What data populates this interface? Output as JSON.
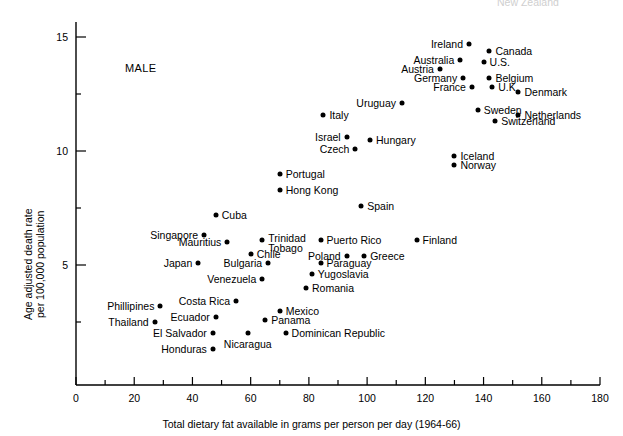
{
  "figure": {
    "annotation": "MALE",
    "clipped_top_label": "New Zealand",
    "xlabel": "Total dietary fat available in grams per person per day (1964-66)",
    "ylabel_line1": "Age adjusted death rate",
    "ylabel_line2": "per 100,000 population"
  },
  "chart_data": {
    "type": "scatter",
    "title": "",
    "xlabel": "Total dietary fat available in grams per person per day (1964-66)",
    "ylabel": "Age adjusted death rate per 100,000 population",
    "xlim": [
      0,
      180
    ],
    "ylim": [
      0,
      16
    ],
    "xticks": [
      0,
      20,
      40,
      60,
      80,
      100,
      120,
      140,
      160,
      180
    ],
    "yticks": [
      5,
      10,
      15
    ],
    "xminor_step": 10,
    "yminor_step": 2.5,
    "grid": false,
    "legend": null,
    "annotations": [
      "MALE"
    ],
    "series_name": "Male age adjusted breast/intestine cancer death rate",
    "points": [
      {
        "label": "Ireland",
        "x": 135,
        "y": 14.7,
        "side": "right"
      },
      {
        "label": "Canada",
        "x": 142,
        "y": 14.4,
        "side": "left"
      },
      {
        "label": "Australia",
        "x": 132,
        "y": 14.0,
        "side": "right"
      },
      {
        "label": "U.S.",
        "x": 140,
        "y": 13.9,
        "side": "left"
      },
      {
        "label": "Austria",
        "x": 125,
        "y": 13.6,
        "side": "right"
      },
      {
        "label": "Germany",
        "x": 133,
        "y": 13.2,
        "side": "right"
      },
      {
        "label": "Belgium",
        "x": 142,
        "y": 13.2,
        "side": "left"
      },
      {
        "label": "France",
        "x": 136,
        "y": 12.8,
        "side": "right"
      },
      {
        "label": "U.K.",
        "x": 143,
        "y": 12.8,
        "side": "left"
      },
      {
        "label": "Denmark",
        "x": 152,
        "y": 12.6,
        "side": "left"
      },
      {
        "label": "Uruguay",
        "x": 112,
        "y": 12.1,
        "side": "right"
      },
      {
        "label": "Sweden",
        "x": 138,
        "y": 11.8,
        "side": "left"
      },
      {
        "label": "Netherlands",
        "x": 152,
        "y": 11.6,
        "side": "left"
      },
      {
        "label": "Switzerland",
        "x": 144,
        "y": 11.3,
        "side": "left"
      },
      {
        "label": "Italy",
        "x": 85,
        "y": 11.6,
        "side": "left"
      },
      {
        "label": "Israel",
        "x": 93,
        "y": 10.6,
        "side": "right"
      },
      {
        "label": "Hungary",
        "x": 101,
        "y": 10.5,
        "side": "left"
      },
      {
        "label": "Czech",
        "x": 96,
        "y": 10.1,
        "side": "right"
      },
      {
        "label": "Iceland",
        "x": 130,
        "y": 9.8,
        "side": "left"
      },
      {
        "label": "Norway",
        "x": 130,
        "y": 9.4,
        "side": "left"
      },
      {
        "label": "Portugal",
        "x": 70,
        "y": 9.0,
        "side": "left"
      },
      {
        "label": "Hong Kong",
        "x": 70,
        "y": 8.3,
        "side": "left"
      },
      {
        "label": "Spain",
        "x": 98,
        "y": 7.6,
        "side": "left"
      },
      {
        "label": "Cuba",
        "x": 48,
        "y": 7.2,
        "side": "left"
      },
      {
        "label": "Singapore",
        "x": 44,
        "y": 6.3,
        "side": "right"
      },
      {
        "label": "Trinidad Tobago",
        "x": 64,
        "y": 6.1,
        "side": "left"
      },
      {
        "label": "Puerto Rico",
        "x": 84,
        "y": 6.1,
        "side": "left"
      },
      {
        "label": "Mauritius",
        "x": 52,
        "y": 6.0,
        "side": "right"
      },
      {
        "label": "Finland",
        "x": 117,
        "y": 6.1,
        "side": "left"
      },
      {
        "label": "Chile",
        "x": 60,
        "y": 5.5,
        "side": "left"
      },
      {
        "label": "Poland",
        "x": 93,
        "y": 5.4,
        "side": "right"
      },
      {
        "label": "Greece",
        "x": 99,
        "y": 5.4,
        "side": "left"
      },
      {
        "label": "Japan",
        "x": 42,
        "y": 5.1,
        "side": "right"
      },
      {
        "label": "Bulgaria",
        "x": 66,
        "y": 5.1,
        "side": "right"
      },
      {
        "label": "Paraguay",
        "x": 84,
        "y": 5.1,
        "side": "left"
      },
      {
        "label": "Yugoslavia",
        "x": 81,
        "y": 4.6,
        "side": "left"
      },
      {
        "label": "Venezuela",
        "x": 64,
        "y": 4.4,
        "side": "right"
      },
      {
        "label": "Romania",
        "x": 79,
        "y": 4.0,
        "side": "left"
      },
      {
        "label": "Costa Rica",
        "x": 55,
        "y": 3.4,
        "side": "right"
      },
      {
        "label": "Phillipines",
        "x": 29,
        "y": 3.2,
        "side": "right"
      },
      {
        "label": "Mexico",
        "x": 70,
        "y": 3.0,
        "side": "left"
      },
      {
        "label": "Ecuador",
        "x": 48,
        "y": 2.7,
        "side": "right"
      },
      {
        "label": "Thailand",
        "x": 27,
        "y": 2.5,
        "side": "right"
      },
      {
        "label": "Panama",
        "x": 65,
        "y": 2.6,
        "side": "left"
      },
      {
        "label": "El Salvador",
        "x": 47,
        "y": 2.0,
        "side": "right"
      },
      {
        "label": "Nicaragua",
        "x": 59,
        "y": 2.0,
        "side": "below"
      },
      {
        "label": "Dominican Republic",
        "x": 72,
        "y": 2.0,
        "side": "left"
      },
      {
        "label": "Honduras",
        "x": 47,
        "y": 1.3,
        "side": "right"
      }
    ]
  }
}
